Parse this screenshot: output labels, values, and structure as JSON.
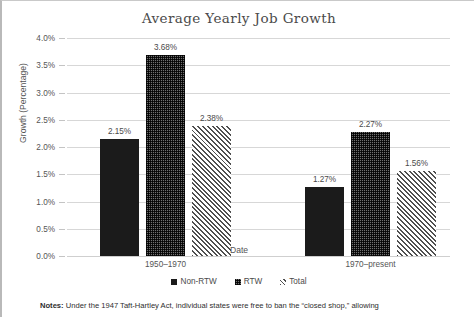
{
  "chart_data": {
    "type": "bar",
    "title": "Average Yearly Job Growth",
    "xlabel": "Date",
    "ylabel": "Growth (Percentage)",
    "categories": [
      "1950–1970",
      "1970–present"
    ],
    "series": [
      {
        "name": "Non-RTW",
        "values": [
          2.15,
          1.27
        ],
        "labels": [
          "2.15%",
          "1.27%"
        ],
        "pattern": "solid-black"
      },
      {
        "name": "RTW",
        "values": [
          3.68,
          2.27
        ],
        "labels": [
          "3.68%",
          "2.27%"
        ],
        "pattern": "checker-dot"
      },
      {
        "name": "Total",
        "values": [
          2.38,
          1.56
        ],
        "labels": [
          "2.38%",
          "1.56%"
        ],
        "pattern": "diagonal-hatch"
      }
    ],
    "ylim": [
      0,
      4.0
    ],
    "ytick_step": 0.5,
    "ytick_labels": [
      "4.0%",
      "3.5%",
      "3.0%",
      "2.5%",
      "2.0%",
      "1.5%",
      "1.0%",
      "0.5%",
      "0.0%"
    ],
    "ytick_values": [
      4.0,
      3.5,
      3.0,
      2.5,
      2.0,
      1.5,
      1.0,
      0.5,
      0.0
    ],
    "grid": true,
    "legend_position": "bottom",
    "units": "percent"
  },
  "notes": {
    "label": "Notes:",
    "line1": "Under the 1947 Taft-Hartley Act, individual states were free to ban the “closed shop,” allowing"
  },
  "colors": {
    "non_rtw": "#1b1b1b",
    "rtw": "#6f6f6f",
    "total": "#4f4f4f",
    "gridline": "#d7d7d7",
    "text": "#4a4a4a"
  }
}
